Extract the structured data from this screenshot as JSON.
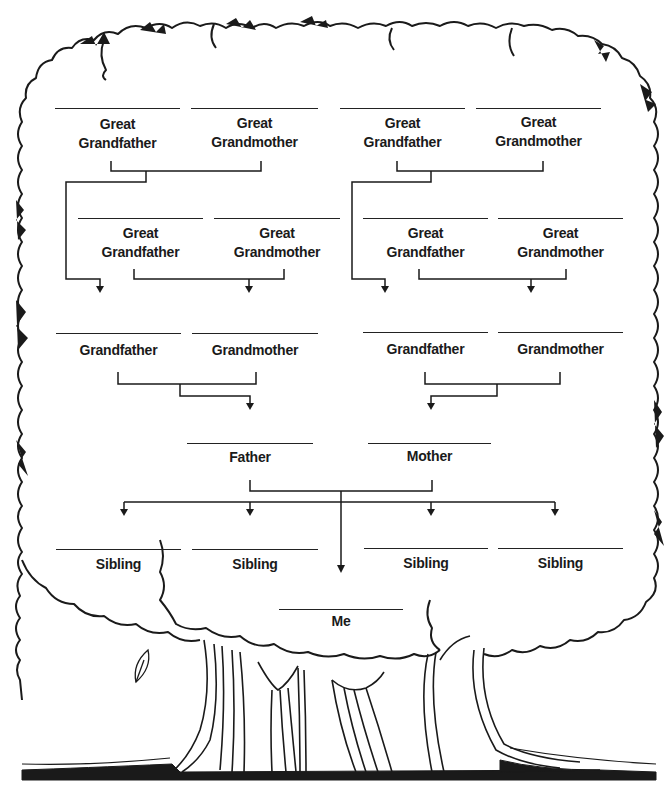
{
  "diagram": {
    "colors": {
      "ink": "#1a1a1a",
      "background": "#ffffff"
    },
    "generations": [
      {
        "name": "great-grandparents-top",
        "members": [
          {
            "id": "ggf1",
            "line1": "Great",
            "line2": "Grandfather"
          },
          {
            "id": "ggm1",
            "line1": "Great",
            "line2": "Grandmother"
          },
          {
            "id": "ggf2",
            "line1": "Great",
            "line2": "Grandfather"
          },
          {
            "id": "ggm2",
            "line1": "Great",
            "line2": "Grandmother"
          }
        ]
      },
      {
        "name": "great-grandparents-second",
        "members": [
          {
            "id": "ggf3",
            "line1": "Great",
            "line2": "Grandfather"
          },
          {
            "id": "ggm3",
            "line1": "Great",
            "line2": "Grandmother"
          },
          {
            "id": "ggf4",
            "line1": "Great",
            "line2": "Grandfather"
          },
          {
            "id": "ggm4",
            "line1": "Great",
            "line2": "Grandmother"
          }
        ]
      },
      {
        "name": "grandparents",
        "members": [
          {
            "id": "gf1",
            "label": "Grandfather"
          },
          {
            "id": "gm1",
            "label": "Grandmother"
          },
          {
            "id": "gf2",
            "label": "Grandfather"
          },
          {
            "id": "gm2",
            "label": "Grandmother"
          }
        ]
      },
      {
        "name": "parents",
        "members": [
          {
            "id": "father",
            "label": "Father"
          },
          {
            "id": "mother",
            "label": "Mother"
          }
        ]
      },
      {
        "name": "siblings",
        "members": [
          {
            "id": "sib1",
            "label": "Sibling"
          },
          {
            "id": "sib2",
            "label": "Sibling"
          },
          {
            "id": "sib3",
            "label": "Sibling"
          },
          {
            "id": "sib4",
            "label": "Sibling"
          }
        ]
      },
      {
        "name": "self",
        "members": [
          {
            "id": "me",
            "label": "Me"
          }
        ]
      }
    ]
  }
}
